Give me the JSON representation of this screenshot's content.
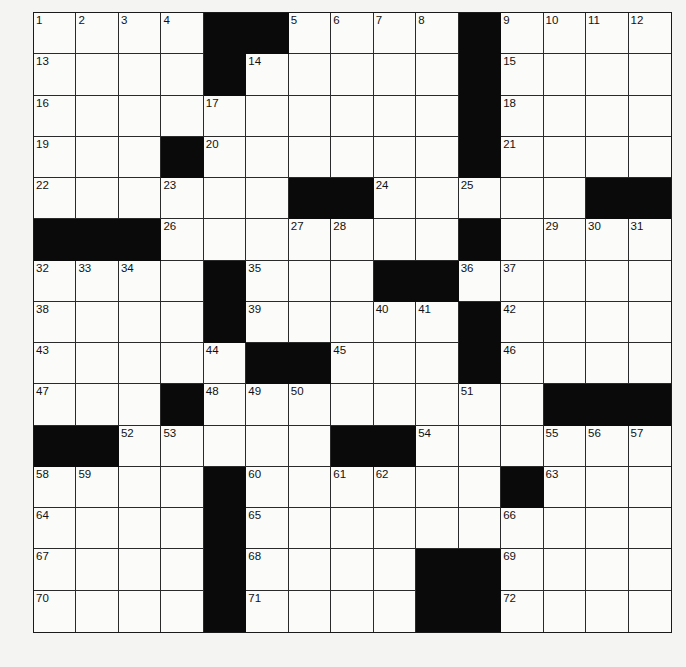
{
  "puzzle": {
    "rows": 15,
    "cols": 15,
    "layout": [
      "....##....#....",
      "....#.....#....",
      "..........#....",
      "...#......#....",
      "......##.....##",
      "###.......#....",
      "....#...##.....",
      "....#.....#....",
      ".....##...#....",
      "...#........###",
      "##.....##......",
      "....#......#...",
      "....#..........",
      "....#....##....",
      "....#....##...."
    ],
    "numbers": [
      [
        1,
        2,
        3,
        4,
        0,
        0,
        5,
        6,
        7,
        8,
        0,
        9,
        10,
        11,
        12
      ],
      [
        13,
        0,
        0,
        0,
        0,
        14,
        0,
        0,
        0,
        0,
        0,
        15,
        0,
        0,
        0
      ],
      [
        16,
        0,
        0,
        0,
        17,
        0,
        0,
        0,
        0,
        0,
        0,
        18,
        0,
        0,
        0
      ],
      [
        19,
        0,
        0,
        0,
        20,
        0,
        0,
        0,
        0,
        0,
        0,
        21,
        0,
        0,
        0
      ],
      [
        22,
        0,
        0,
        23,
        0,
        0,
        0,
        0,
        24,
        0,
        25,
        0,
        0,
        0,
        0
      ],
      [
        0,
        0,
        0,
        26,
        0,
        0,
        27,
        28,
        0,
        0,
        0,
        0,
        29,
        30,
        31
      ],
      [
        32,
        33,
        34,
        0,
        0,
        35,
        0,
        0,
        0,
        0,
        36,
        37,
        0,
        0,
        0
      ],
      [
        38,
        0,
        0,
        0,
        0,
        39,
        0,
        0,
        40,
        41,
        0,
        42,
        0,
        0,
        0
      ],
      [
        43,
        0,
        0,
        0,
        44,
        0,
        0,
        45,
        0,
        0,
        0,
        46,
        0,
        0,
        0
      ],
      [
        47,
        0,
        0,
        0,
        48,
        49,
        50,
        0,
        0,
        0,
        51,
        0,
        0,
        0,
        0
      ],
      [
        0,
        0,
        52,
        53,
        0,
        0,
        0,
        0,
        0,
        54,
        0,
        0,
        55,
        56,
        57
      ],
      [
        58,
        59,
        0,
        0,
        0,
        60,
        0,
        61,
        62,
        0,
        0,
        0,
        63,
        0,
        0
      ],
      [
        64,
        0,
        0,
        0,
        0,
        65,
        0,
        0,
        0,
        0,
        0,
        66,
        0,
        0,
        0
      ],
      [
        67,
        0,
        0,
        0,
        0,
        68,
        0,
        0,
        0,
        0,
        0,
        69,
        0,
        0,
        0
      ],
      [
        70,
        0,
        0,
        0,
        0,
        71,
        0,
        0,
        0,
        0,
        0,
        72,
        0,
        0,
        0
      ]
    ],
    "colors": {
      "block": "#0a0a0a",
      "cell": "#fbfbfa",
      "line": "#2a2a2a",
      "page": "#f4f4f2"
    }
  }
}
